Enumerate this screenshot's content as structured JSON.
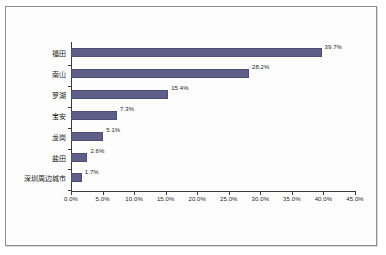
{
  "chart_data": {
    "type": "bar",
    "orientation": "horizontal",
    "title": "",
    "subtitle": "",
    "xlabel": "",
    "ylabel": "",
    "categories": [
      "福田",
      "南山",
      "罗湖",
      "宝安",
      "龙岗",
      "盐田",
      "深圳周边城市"
    ],
    "values": [
      39.7,
      28.2,
      15.4,
      7.3,
      5.1,
      2.6,
      1.7
    ],
    "data_labels": [
      "39.7%",
      "28.2%",
      "15.4%",
      "7.3%",
      "5.1%",
      "2.6%",
      "1.7%"
    ],
    "xlim": [
      0,
      45
    ],
    "xticks": [
      0,
      5,
      10,
      15,
      20,
      25,
      30,
      35,
      40,
      45
    ],
    "xtick_labels": [
      "0.0%",
      "5.0%",
      "10.0%",
      "15.0%",
      "20.0%",
      "25.0%",
      "30.0%",
      "35.0%",
      "40.0%",
      "45.0%"
    ],
    "grid": false,
    "legend": "none",
    "series": [
      {
        "name": "",
        "values": [
          39.7,
          28.2,
          15.4,
          7.3,
          5.1,
          2.6,
          1.7
        ]
      }
    ]
  },
  "style": {
    "bar_color": "#5e5e89",
    "bar_border_color": "#4d4d75",
    "axis_color": "#3b3b3b",
    "text_color": "#1a1a1a",
    "plot_background": "#ffffff",
    "frame_border_color": "#8e8e8e"
  }
}
